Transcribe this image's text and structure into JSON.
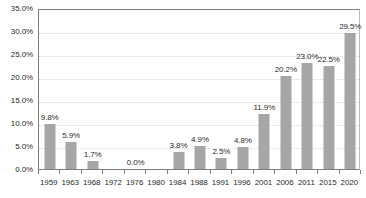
{
  "chart_data": {
    "type": "bar",
    "title": "",
    "subtitle": "",
    "xlabel": "",
    "ylabel": "",
    "categories": [
      "1959",
      "1963",
      "1968",
      "1972",
      "1976",
      "1980",
      "1984",
      "1988",
      "1991",
      "1996",
      "2001",
      "2006",
      "2011",
      "2015",
      "2020"
    ],
    "values": [
      9.8,
      5.9,
      1.7,
      0.0,
      0.0,
      0.0,
      3.8,
      4.9,
      2.5,
      4.8,
      11.9,
      20.2,
      23.0,
      22.5,
      29.5
    ],
    "point_labels": [
      "9.8%",
      "5.9%",
      "1.7%",
      "",
      "0.0%",
      "",
      "3.8%",
      "4.9%",
      "2.5%",
      "4.8%",
      "11.9%",
      "20.2%",
      "23.0%",
      "22.5%",
      "29.5%"
    ],
    "ylim": [
      0,
      35
    ],
    "ytick_values": [
      0,
      5,
      10,
      15,
      20,
      25,
      30,
      35
    ],
    "ytick_labels": [
      "0.0%",
      "5.0%",
      "10.0%",
      "15.0%",
      "20.0%",
      "25.0%",
      "30.0%",
      "35.0%"
    ],
    "grid": true,
    "grid_axis": "y",
    "legend": "none",
    "colors": {
      "bar": "#a6a6a6",
      "axis": "#7f7f7f",
      "gridline": "#d9d9d9",
      "text": "#2b2b2b",
      "background": "#ffffff"
    }
  }
}
